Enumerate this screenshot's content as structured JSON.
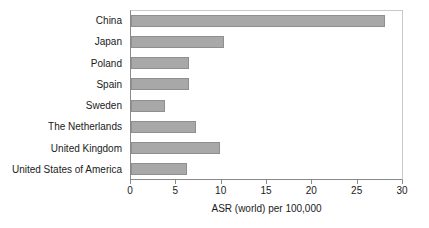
{
  "chart_data": {
    "type": "bar",
    "orientation": "horizontal",
    "title": "",
    "xlabel": "ASR (world) per 100,000",
    "ylabel": "",
    "categories": [
      "China",
      "Japan",
      "Poland",
      "Spain",
      "Sweden",
      "The Netherlands",
      "United Kingdom",
      "United States of America"
    ],
    "values": [
      28.0,
      10.3,
      6.4,
      6.4,
      3.7,
      7.2,
      9.8,
      6.2
    ],
    "xlim": [
      0,
      30
    ],
    "xticks": [
      0,
      5,
      10,
      15,
      20,
      25,
      30
    ],
    "xtick_labels": [
      "0",
      "5",
      "10",
      "15",
      "20",
      "25",
      "30"
    ],
    "grid": false,
    "legend": false,
    "bar_color": "#a8a8a8",
    "bar_border_color": "#8f8f8f",
    "axis_color": "#8a8a8a",
    "frame_color": "#c9c9c9",
    "background": "#ffffff"
  }
}
